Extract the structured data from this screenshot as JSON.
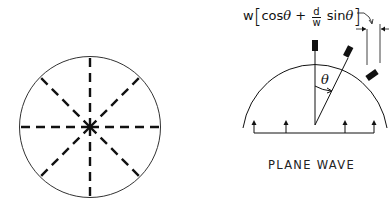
{
  "left_figure": {
    "description": "circle with 8 dashed radial lines",
    "spoke_count": 8
  },
  "right_figure": {
    "formula": {
      "prefix": "w",
      "open_bracket": "[",
      "term1": "cos",
      "theta": "θ",
      "plus": "+",
      "frac_num": "d",
      "frac_den": "w",
      "term2": "sin",
      "close_bracket": "]"
    },
    "angle_label": "θ",
    "caption": "PLANE WAVE"
  },
  "colors": {
    "stroke": "#111111",
    "background": "#ffffff"
  }
}
